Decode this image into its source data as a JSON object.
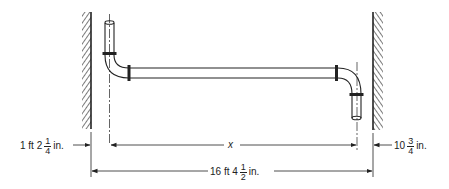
{
  "diagram": {
    "labels": {
      "left_offset": {
        "whole": "1 ft 2",
        "num": "1",
        "den": "4",
        "unit": "in."
      },
      "right_offset": {
        "whole": "10",
        "num": "3",
        "den": "4",
        "unit": "in."
      },
      "unknown_length": "x",
      "total_length": {
        "whole": "16 ft 4",
        "num": "1",
        "den": "2",
        "unit": "in."
      }
    },
    "colors": {
      "line": "#222222",
      "hatch": "#333333",
      "background": "#ffffff"
    }
  }
}
